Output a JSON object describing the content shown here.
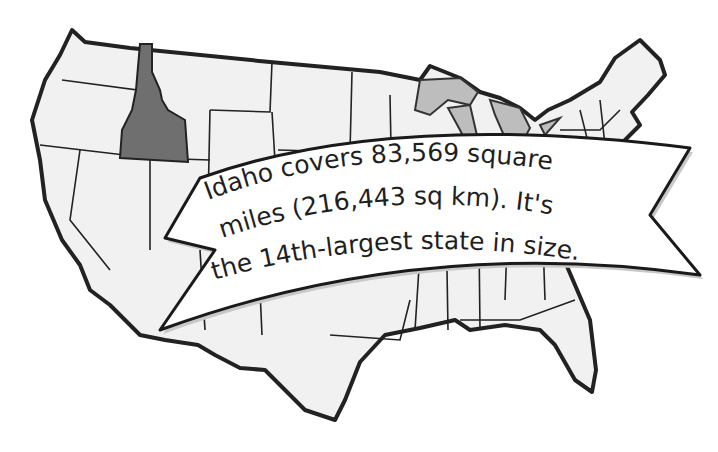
{
  "map": {
    "title": "United States map highlighting Idaho",
    "highlighted_state": "Idaho",
    "colors": {
      "highlight": "#6f6f6f",
      "states_fill": "#f1f1f1",
      "great_lakes": "#bdbdbd",
      "outline": "#222222",
      "background": "#ffffff"
    }
  },
  "banner": {
    "line1": "Idaho covers 83,569 square",
    "line2": "miles (216,443 sq km). It's",
    "line3": "the 14th-largest state in size."
  }
}
